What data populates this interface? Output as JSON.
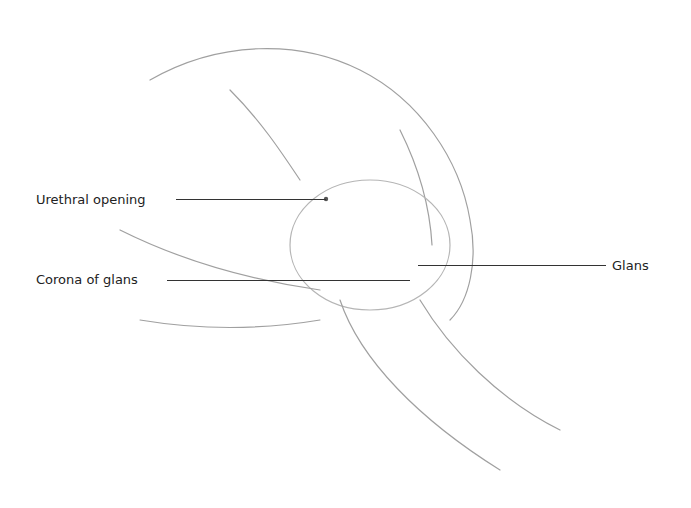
{
  "figure": {
    "type": "anatomical-illustration",
    "style": "pencil sketch (schematic)",
    "labels": [
      {
        "text": "Urethral opening",
        "x": 36,
        "y": 192,
        "line_x1": 176,
        "line_x2": 326,
        "line_y": 199,
        "side": "left"
      },
      {
        "text": "Corona of glans",
        "x": 36,
        "y": 272,
        "line_x1": 167,
        "line_x2": 410,
        "line_y": 280,
        "side": "left"
      },
      {
        "text": "Glans",
        "x": 612,
        "y": 258,
        "line_x1": 418,
        "line_x2": 606,
        "line_y": 265,
        "side": "right"
      }
    ],
    "colors": {
      "line": "#333333",
      "text": "#222222",
      "sketch": "#9a9a9a",
      "background": "#ffffff"
    }
  }
}
